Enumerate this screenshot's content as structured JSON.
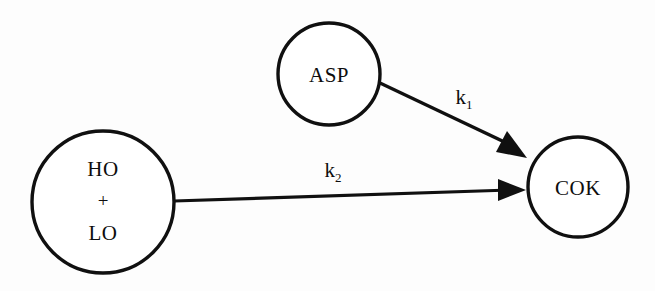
{
  "diagram": {
    "background_color": "#fdfdfd",
    "stroke_color": "#101010",
    "nodes": [
      {
        "id": "asp",
        "name": "ASP",
        "label": "ASP",
        "shape": "circle",
        "cx": 329,
        "cy": 74,
        "r": 51
      },
      {
        "id": "feed",
        "name": "HO + LO",
        "label_line1": "HO",
        "label_line2": "+",
        "label_line3": "LO",
        "shape": "circle",
        "cx": 103,
        "cy": 202,
        "r": 71
      },
      {
        "id": "cok",
        "name": "COK",
        "label": "COK",
        "shape": "circle",
        "cx": 578,
        "cy": 187,
        "r": 50
      }
    ],
    "edges": [
      {
        "id": "asp-to-cok",
        "from": "ASP",
        "to": "COK",
        "rate_label": "k",
        "rate_subscript": "1",
        "label_x": 464,
        "label_y": 104
      },
      {
        "id": "feed-to-cok",
        "from": "HO + LO",
        "to": "COK",
        "rate_label": "k",
        "rate_subscript": "2",
        "label_x": 333,
        "label_y": 177
      }
    ]
  }
}
